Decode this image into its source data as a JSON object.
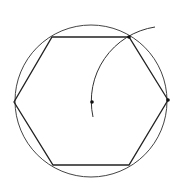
{
  "diagram": {
    "colors": {
      "background": "#ffffff",
      "stroke": "#333333"
    },
    "circle": {
      "cx": 91,
      "cy": 101,
      "r": 76
    },
    "hexagon": {
      "vertices": [
        [
          168,
          100
        ],
        [
          129,
          37
        ],
        [
          52,
          37
        ],
        [
          14,
          102
        ],
        [
          53,
          165
        ],
        [
          129,
          165
        ]
      ]
    },
    "construction_arc": {
      "center": [
        168,
        100
      ],
      "radius": 75,
      "start": [
        93,
        117
      ],
      "end": [
        155,
        27
      ]
    },
    "points": [
      {
        "name": "center-point",
        "x": 92,
        "y": 102
      },
      {
        "name": "vertex-top-right",
        "x": 129,
        "y": 37
      },
      {
        "name": "vertex-right",
        "x": 168,
        "y": 100
      }
    ]
  }
}
